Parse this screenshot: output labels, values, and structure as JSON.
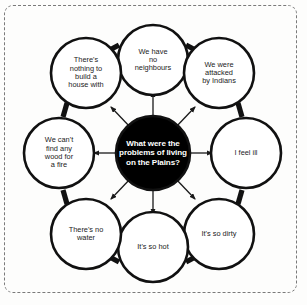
{
  "diagram": {
    "type": "mind-map",
    "center": {
      "text": "What were the problems of living on the Plains?",
      "fill": "#000000",
      "text_color": "#ffffff"
    },
    "style": {
      "circle_stroke": "#111111",
      "connector_stroke": "#111111",
      "arrow_stroke": "#1a1a1a",
      "frame_border": "#7a7a7a",
      "background": "#fdfdfc"
    },
    "nodes": [
      {
        "id": "no-neighbours",
        "text": "We have\nno\nneighbours",
        "position": "top"
      },
      {
        "id": "attacked-by-indians",
        "text": "We were\nattacked\nby Indians",
        "position": "top-right"
      },
      {
        "id": "feel-ill",
        "text": "I feel ill",
        "position": "right"
      },
      {
        "id": "so-dirty",
        "text": "It's so dirty",
        "position": "bottom-right"
      },
      {
        "id": "so-hot",
        "text": "It's so hot",
        "position": "bottom"
      },
      {
        "id": "no-water",
        "text": "There's no\nwater",
        "position": "bottom-left"
      },
      {
        "id": "no-wood",
        "text": "We can't\nfind any\nwood for\na fire",
        "position": "left"
      },
      {
        "id": "nothing-to-build",
        "text": "There's\nnothing to\nbuild a\nhouse with",
        "position": "top-left"
      }
    ]
  }
}
